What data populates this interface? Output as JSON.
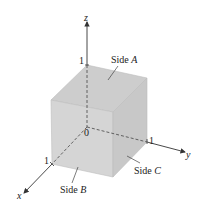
{
  "diagram": {
    "type": "unit-cube-3d-axes",
    "axes": {
      "x": {
        "label": "x",
        "tick": "1"
      },
      "y": {
        "label": "y",
        "tick": "1"
      },
      "z": {
        "label": "z",
        "tick": "1"
      },
      "origin": "0"
    },
    "sides": [
      {
        "id": "A",
        "prefix": "Side ",
        "letter": "A"
      },
      {
        "id": "B",
        "prefix": "Side ",
        "letter": "B"
      },
      {
        "id": "C",
        "prefix": "Side ",
        "letter": "C"
      }
    ],
    "colors": {
      "top_face": "#cfcfcf",
      "front_face": "#d6d6d6",
      "right_face": "#c9c9c9",
      "edge": "#b8b8b8",
      "axis": "#333333"
    }
  }
}
